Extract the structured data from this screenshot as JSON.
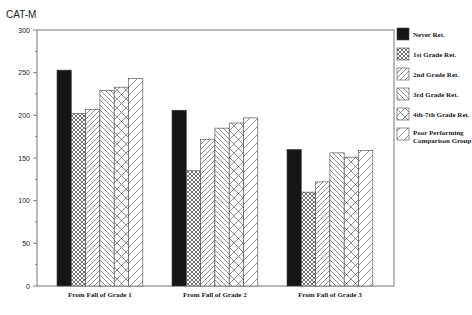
{
  "chart_data": {
    "type": "bar",
    "title": "CAT-M",
    "xlabel": "",
    "ylabel": "",
    "ylim": [
      0,
      300
    ],
    "yticks": [
      0,
      50,
      100,
      150,
      200,
      250,
      300
    ],
    "grid": false,
    "legend_position": "right",
    "categories": [
      "From Fall of Grade 1",
      "From Fall of Grade 2",
      "From Fall of Grade 3"
    ],
    "series": [
      {
        "name": "Never Ret.",
        "pattern": "solid-black",
        "values": [
          253,
          206,
          160
        ]
      },
      {
        "name": "1st Grade Ret.",
        "pattern": "crosshatch-fine",
        "values": [
          202,
          135,
          110
        ]
      },
      {
        "name": "2nd Grade Ret.",
        "pattern": "diagonal-forward",
        "values": [
          207,
          172,
          122
        ]
      },
      {
        "name": "3rd Grade Ret.",
        "pattern": "diagonal-backward",
        "values": [
          229,
          185,
          156
        ]
      },
      {
        "name": "4th-7th Grade Ret.",
        "pattern": "crosshatch-wide",
        "values": [
          233,
          191,
          151
        ]
      },
      {
        "name": "Poor Performing Comparison Group",
        "pattern": "diagonal-forward-wide",
        "values": [
          243,
          197,
          159
        ]
      }
    ]
  },
  "title": "CAT-M",
  "y_ticks": [
    "0",
    "50",
    "100",
    "150",
    "200",
    "250",
    "300"
  ],
  "categories": [
    "From Fall of Grade 1",
    "From Fall of Grade 2",
    "From Fall of Grade 3"
  ],
  "legend": [
    {
      "label": "Never Ret."
    },
    {
      "label": "1st Grade Ret."
    },
    {
      "label": "2nd Grade Ret."
    },
    {
      "label": "3rd Grade Ret."
    },
    {
      "label": "4th-7th Grade Ret."
    },
    {
      "label_line1": "Poor Performing",
      "label_line2": "Comparison Group"
    }
  ]
}
